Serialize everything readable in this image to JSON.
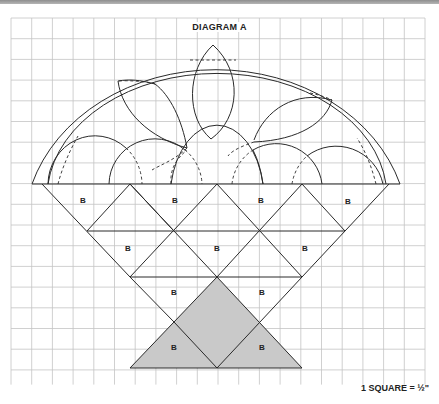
{
  "diagram": {
    "title": "DIAGRAM A",
    "scale_label": "1 SQUARE = ½\"",
    "piece_label": "B",
    "colors": {
      "grid": "#c4c4c4",
      "line": "#2a2a2a",
      "shade": "#c9c9c9",
      "top_strip": "#9e9e9e"
    },
    "grid": {
      "cols": 20,
      "rows": 18,
      "cell_px": 20.7
    },
    "b_labels": [
      {
        "x": 83,
        "y": 200,
        "text": "B"
      },
      {
        "x": 175,
        "y": 200,
        "text": "B"
      },
      {
        "x": 261,
        "y": 200,
        "text": "B"
      },
      {
        "x": 348,
        "y": 201,
        "text": "B"
      },
      {
        "x": 128,
        "y": 248,
        "text": "B"
      },
      {
        "x": 217,
        "y": 248,
        "text": "B"
      },
      {
        "x": 305,
        "y": 248,
        "text": "B"
      },
      {
        "x": 174,
        "y": 292,
        "text": "B"
      },
      {
        "x": 262,
        "y": 292,
        "text": "B"
      },
      {
        "x": 174,
        "y": 347,
        "text": "B"
      },
      {
        "x": 262,
        "y": 347,
        "text": "B"
      }
    ]
  }
}
